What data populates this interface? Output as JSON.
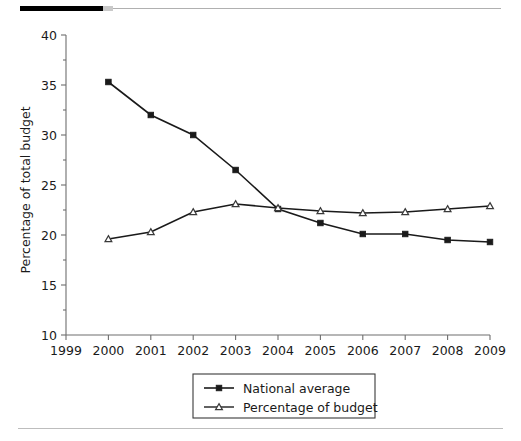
{
  "figure": {
    "top_rule": {
      "black_label": "black-bar",
      "gray_label": "gray-bar"
    },
    "bottom_rule_label": "bottom-divider"
  },
  "chart_data": {
    "type": "line",
    "title": "",
    "xlabel": "",
    "ylabel": "Percentage of total budget",
    "x": [
      1999,
      2000,
      2001,
      2002,
      2003,
      2004,
      2005,
      2006,
      2007,
      2008,
      2009
    ],
    "xtick_labels": [
      "1999",
      "2000",
      "2001",
      "2002",
      "2003",
      "2004",
      "2005",
      "2006",
      "2007",
      "2008",
      "2009"
    ],
    "ytick_labels": [
      "10",
      "15",
      "20",
      "25",
      "30",
      "35",
      "40"
    ],
    "ytick_values": [
      10,
      15,
      20,
      25,
      30,
      35,
      40
    ],
    "yminor_values": [
      12.5,
      17.5,
      22.5,
      27.5,
      32.5,
      37.5
    ],
    "xlim": [
      1999,
      2009
    ],
    "ylim": [
      10,
      40
    ],
    "grid": false,
    "legend_position": "bottom-center",
    "series": [
      {
        "name": "National average",
        "marker": "filled-square",
        "color": "#1a1a1a",
        "x": [
          2000,
          2001,
          2002,
          2003,
          2004,
          2005,
          2006,
          2007,
          2008,
          2009
        ],
        "values": [
          35.3,
          32.0,
          30.0,
          26.5,
          22.6,
          21.2,
          20.1,
          20.1,
          19.5,
          19.3
        ]
      },
      {
        "name": "Percentage of budget",
        "marker": "open-triangle",
        "color": "#3a3a3a",
        "x": [
          2000,
          2001,
          2002,
          2003,
          2004,
          2005,
          2006,
          2007,
          2008,
          2009
        ],
        "values": [
          19.6,
          20.3,
          22.3,
          23.1,
          22.7,
          22.4,
          22.2,
          22.3,
          22.6,
          22.9
        ]
      }
    ],
    "legend": [
      {
        "label": "National average",
        "marker": "filled-square"
      },
      {
        "label": "Percentage of budget",
        "marker": "open-triangle"
      }
    ]
  }
}
